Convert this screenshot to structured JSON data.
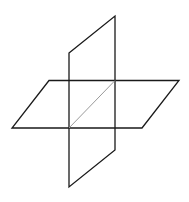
{
  "diagram": {
    "title": "",
    "colors": {
      "background": "#ffffff",
      "plane_stroke": "#1a1a1a",
      "intersection_stroke": "#9a9a9a"
    },
    "horizontal_plane": {
      "points": "49,80.5 179,80.5 142,128 12,128"
    },
    "vertical_plane": {
      "points": "69,53 115,16 115,150 69,187"
    },
    "intersection_line": {
      "x1": 69,
      "y1": 128,
      "x2": 115,
      "y2": 80.5
    }
  }
}
